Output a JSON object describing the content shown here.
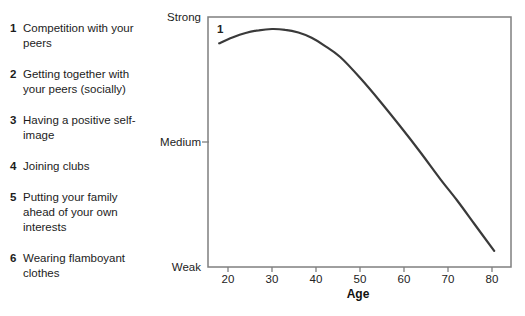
{
  "legend": {
    "items": [
      {
        "num": "1",
        "text": "Competition with your peers"
      },
      {
        "num": "2",
        "text": "Getting together with your peers (socially)"
      },
      {
        "num": "3",
        "text": "Having a positive self-image"
      },
      {
        "num": "4",
        "text": "Joining clubs"
      },
      {
        "num": "5",
        "text": "Putting your family ahead of your own interests"
      },
      {
        "num": "6",
        "text": "Wearing flamboyant clothes"
      }
    ]
  },
  "chart_data": {
    "type": "line",
    "title": "",
    "xlabel": "Age",
    "ylabel": "",
    "x_ticks": [
      "20",
      "30",
      "40",
      "50",
      "60",
      "70",
      "80"
    ],
    "x_axis_range": [
      15,
      84
    ],
    "y_tick_labels": [
      "Strong",
      "Medium",
      "Weak"
    ],
    "y_scale_note": "qualitative scale: 0 = Weak, 0.5 = Medium, 1 = Strong",
    "grid": "off",
    "legend_position": "outside-left",
    "series": [
      {
        "name": "1",
        "label_in_plot": "1",
        "points": [
          [
            18,
            0.895
          ],
          [
            21,
            0.918
          ],
          [
            24,
            0.936
          ],
          [
            27,
            0.947
          ],
          [
            30,
            0.952
          ],
          [
            33,
            0.949
          ],
          [
            36,
            0.938
          ],
          [
            39,
            0.917
          ],
          [
            42,
            0.885
          ],
          [
            45.5,
            0.84
          ],
          [
            50,
            0.757
          ],
          [
            54.5,
            0.664
          ],
          [
            59,
            0.566
          ],
          [
            63.6,
            0.462
          ],
          [
            68.2,
            0.353
          ],
          [
            72,
            0.268
          ],
          [
            76,
            0.172
          ],
          [
            80.5,
            0.065
          ]
        ]
      }
    ],
    "colors": {
      "curve": "#3a3a3a",
      "axis": "#7f7f7f",
      "tick_text": "#222222"
    }
  }
}
